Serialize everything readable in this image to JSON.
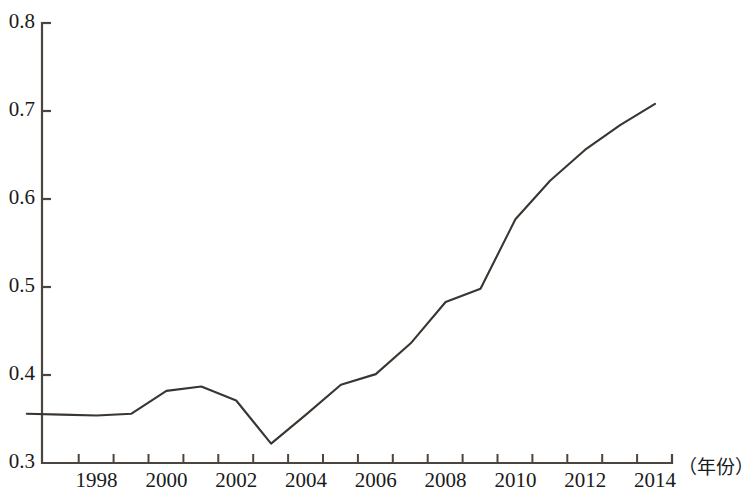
{
  "chart_data": {
    "type": "line",
    "title": "",
    "xlabel": "（年份）",
    "ylabel": "",
    "x": [
      1996,
      1997,
      1998,
      1999,
      2000,
      2001,
      2002,
      2003,
      2004,
      2005,
      2006,
      2007,
      2008,
      2009,
      2010,
      2011,
      2012,
      2013,
      2014
    ],
    "values": [
      0.356,
      0.355,
      0.354,
      0.356,
      0.382,
      0.387,
      0.371,
      0.322,
      0.355,
      0.389,
      0.401,
      0.436,
      0.483,
      0.498,
      0.577,
      0.621,
      0.656,
      0.684,
      0.708
    ],
    "series": [
      {
        "name": "",
        "values": [
          0.356,
          0.355,
          0.354,
          0.356,
          0.382,
          0.387,
          0.371,
          0.322,
          0.355,
          0.389,
          0.401,
          0.436,
          0.483,
          0.498,
          0.577,
          0.621,
          0.656,
          0.684,
          0.708
        ]
      }
    ],
    "xlim": [
      1996,
      2014.5
    ],
    "ylim": [
      0.3,
      0.8
    ],
    "x_tick_labels": [
      "1998",
      "2000",
      "2002",
      "2004",
      "2006",
      "2008",
      "2010",
      "2012",
      "2014"
    ],
    "x_tick_values": [
      1998,
      2000,
      2002,
      2004,
      2006,
      2008,
      2010,
      2012,
      2014
    ],
    "x_minor_ticks_every": 1,
    "y_tick_labels": [
      "0.8",
      "0.7",
      "0.6",
      "0.5",
      "0.4",
      "0.3"
    ],
    "y_tick_values": [
      0.8,
      0.7,
      0.6,
      0.5,
      0.4,
      0.3
    ],
    "grid": false,
    "legend": null,
    "line_color": "#3a3530",
    "axis_color": "#4a4540"
  },
  "axis": {
    "y_labels": [
      "0.8",
      "0.7",
      "0.6",
      "0.5",
      "0.4",
      "0.3"
    ],
    "x_labels": [
      "1998",
      "2000",
      "2002",
      "2004",
      "2006",
      "2008",
      "2010",
      "2012",
      "2014"
    ],
    "x_unit": "（年份）"
  }
}
